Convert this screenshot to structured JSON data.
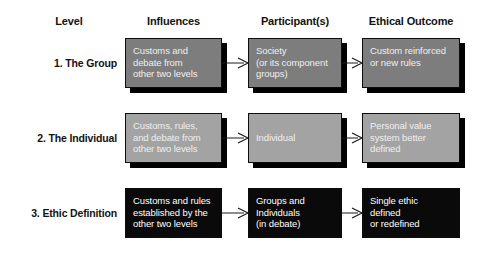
{
  "diagram": {
    "colors": {
      "row1_fill": "#7d7d7d",
      "row2_fill": "#a3a3a3",
      "row3_fill": "#0a0a0a",
      "box_border": "#0d0d0d",
      "text_light": "#efefef",
      "text_dark": "#131313",
      "background": "#ffffff",
      "arrow": "#1a1a1a"
    },
    "headers": {
      "level": "Level",
      "influences": "Influences",
      "participants": "Participant(s)",
      "outcome": "Ethical Outcome"
    },
    "rows": [
      {
        "label": "1. The Group",
        "influences": "Customs and\ndebate from\nother two levels",
        "participants": "Society\n(or its component\ngroups)",
        "outcome": "Custom reinforced\nor new rules"
      },
      {
        "label": "2. The Individual",
        "influences": "Customs, rules,\nand debate from\nother two levels",
        "participants": "Individual",
        "outcome": "Personal value\nsystem better\ndefined"
      },
      {
        "label": "3. Ethic Definition",
        "influences": "Customs and rules\nestablished by the\nother two levels",
        "participants": "Groups and\nIndividuals\n(in debate)",
        "outcome": "Single ethic\ndefined\nor redefined"
      }
    ],
    "arrows": [
      {
        "name": "row1-influences-to-participants"
      },
      {
        "name": "row1-participants-to-outcome"
      },
      {
        "name": "row2-influences-to-participants"
      },
      {
        "name": "row2-participants-to-outcome"
      },
      {
        "name": "row3-influences-to-participants"
      },
      {
        "name": "row3-participants-to-outcome"
      }
    ]
  }
}
